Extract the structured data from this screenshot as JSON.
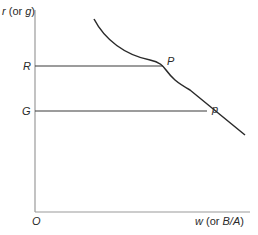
{
  "diagram": {
    "y_axis_label": {
      "var": "r",
      "paren_open": " (or ",
      "alt": "g",
      "paren_close": ")"
    },
    "x_axis_label": {
      "var": "w",
      "paren_open": " (or ",
      "alt": "B/A",
      "paren_close": ")"
    },
    "origin_label": "O",
    "levels": [
      {
        "label": "R",
        "point_label": "P"
      },
      {
        "label": "G",
        "point_label": "p"
      }
    ],
    "colors": {
      "line": "#2a2a2a",
      "axis": "#9a9a9a",
      "text": "#2a2a2a"
    }
  }
}
